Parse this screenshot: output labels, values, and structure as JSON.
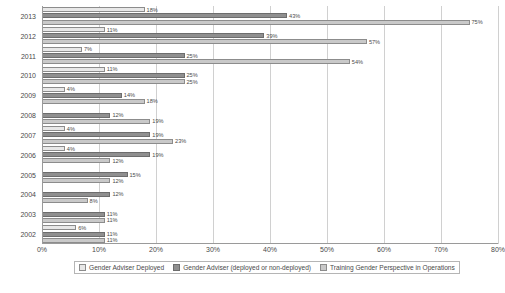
{
  "chart_data": {
    "type": "bar",
    "orientation": "horizontal",
    "title": "",
    "xlabel": "",
    "ylabel": "",
    "xlim": [
      0,
      80
    ],
    "xtick_labels": [
      "0%",
      "10%",
      "20%",
      "30%",
      "40%",
      "50%",
      "60%",
      "70%",
      "80%"
    ],
    "xtick_values": [
      0,
      10,
      20,
      30,
      40,
      50,
      60,
      70,
      80
    ],
    "grid": true,
    "legend_position": "bottom",
    "categories": [
      "2013",
      "2012",
      "2011",
      "2010",
      "2009",
      "2008",
      "2007",
      "2006",
      "2005",
      "2004",
      "2003",
      "2002"
    ],
    "series": [
      {
        "name": "Gender Adviser Deployed",
        "color": "#e8e8e8",
        "values": [
          18,
          11,
          7,
          11,
          4,
          null,
          4,
          4,
          null,
          null,
          null,
          6
        ],
        "labels": [
          "18%",
          "11%",
          "7%",
          "11%",
          "4%",
          "",
          "4%",
          "4%",
          "",
          "",
          "",
          "6%"
        ]
      },
      {
        "name": "Gender Adviser (deployed or non-deployed)",
        "color": "#8f8f8f",
        "values": [
          43,
          39,
          25,
          25,
          14,
          12,
          19,
          19,
          15,
          12,
          11,
          11
        ],
        "labels": [
          "43%",
          "39%",
          "25%",
          "25%",
          "14%",
          "12%",
          "19%",
          "19%",
          "15%",
          "12%",
          "11%",
          "11%"
        ]
      },
      {
        "name": "Training Gender Perspective in Operations",
        "color": "#c9c9c9",
        "values": [
          75,
          57,
          54,
          25,
          18,
          19,
          23,
          12,
          12,
          8,
          11,
          11
        ],
        "labels": [
          "75%",
          "57%",
          "54%",
          "25%",
          "18%",
          "19%",
          "23%",
          "12%",
          "12%",
          "8%",
          "11%",
          "11%"
        ]
      }
    ]
  }
}
